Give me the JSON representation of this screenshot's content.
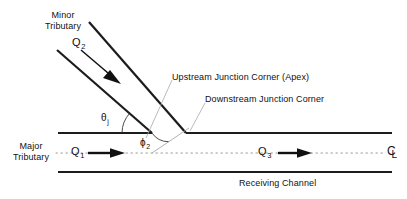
{
  "diagram": {
    "labels": {
      "minor_tributary": "Minor\nTributary",
      "major_tributary": "Major\nTributary",
      "receiving_channel": "Receiving Channel",
      "upstream_corner": "Upstream Junction Corner (Apex)",
      "downstream_corner": "Downstream Junction Corner"
    },
    "discharges": [
      {
        "symbol": "Q",
        "subscript": "1",
        "name": "major-tributary-discharge"
      },
      {
        "symbol": "Q",
        "subscript": "2",
        "name": "minor-tributary-discharge"
      },
      {
        "symbol": "Q",
        "subscript": "3",
        "name": "receiving-channel-discharge"
      }
    ],
    "angles": [
      {
        "symbol": "θ",
        "subscript": "j",
        "name": "junction-angle-theta-j"
      },
      {
        "symbol": "ϕ",
        "subscript": "2",
        "name": "approach-angle-phi-2"
      }
    ],
    "centerline_symbol": {
      "c": "C",
      "l": "L"
    },
    "colors": {
      "bank": "#1c1c1c",
      "centerline": "#9a9a9a",
      "leader": "#a8a8a8",
      "text": "#111111",
      "background": "#ffffff"
    }
  }
}
